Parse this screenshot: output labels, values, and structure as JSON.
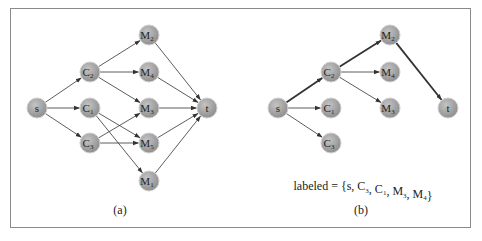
{
  "figure": {
    "colors": {
      "frame": "#8a8a8a",
      "edge": "#333333",
      "node_fill": "#a8a8a8",
      "node_stroke": "#cfcfcf",
      "text": "#222222"
    },
    "panels": [
      {
        "id": "a",
        "caption": "(a)",
        "nodes": [
          {
            "id": "s",
            "base": "s",
            "sub": "",
            "x": 37,
            "y": 108
          },
          {
            "id": "C2",
            "base": "C",
            "sub": "2",
            "x": 90,
            "y": 72
          },
          {
            "id": "C1",
            "base": "C",
            "sub": "1",
            "x": 90,
            "y": 108
          },
          {
            "id": "C3",
            "base": "C",
            "sub": "3",
            "x": 90,
            "y": 143
          },
          {
            "id": "M2",
            "base": "M",
            "sub": "2",
            "x": 149,
            "y": 35
          },
          {
            "id": "M4",
            "base": "M",
            "sub": "4",
            "x": 149,
            "y": 72
          },
          {
            "id": "M3",
            "base": "M",
            "sub": "3",
            "x": 149,
            "y": 108
          },
          {
            "id": "M5",
            "base": "M",
            "sub": "5",
            "x": 149,
            "y": 143
          },
          {
            "id": "M1",
            "base": "M",
            "sub": "1",
            "x": 149,
            "y": 181
          },
          {
            "id": "t",
            "base": "t",
            "sub": "",
            "x": 207,
            "y": 108
          }
        ],
        "edges": [
          {
            "from": "s",
            "to": "C2",
            "bold": false
          },
          {
            "from": "s",
            "to": "C1",
            "bold": false
          },
          {
            "from": "s",
            "to": "C3",
            "bold": false
          },
          {
            "from": "C2",
            "to": "M2",
            "bold": false
          },
          {
            "from": "C2",
            "to": "M4",
            "bold": false
          },
          {
            "from": "C2",
            "to": "M3",
            "bold": false
          },
          {
            "from": "C1",
            "to": "M5",
            "bold": false
          },
          {
            "from": "C1",
            "to": "M1",
            "bold": false
          },
          {
            "from": "C3",
            "to": "M3",
            "bold": false
          },
          {
            "from": "C3",
            "to": "M5",
            "bold": false
          },
          {
            "from": "M2",
            "to": "t",
            "bold": false
          },
          {
            "from": "M4",
            "to": "t",
            "bold": false
          },
          {
            "from": "M3",
            "to": "t",
            "bold": false
          },
          {
            "from": "M5",
            "to": "t",
            "bold": false
          },
          {
            "from": "M1",
            "to": "t",
            "bold": false
          }
        ]
      },
      {
        "id": "b",
        "caption": "(b)",
        "annotation": {
          "prefix": "labeled = {s, C",
          "parts": [
            {
              "t": "labeled = {s, C"
            },
            {
              "sub": "3"
            },
            {
              "t": ", C"
            },
            {
              "sub": "1"
            },
            {
              "t": ", M"
            },
            {
              "sub": "3"
            },
            {
              "t": ", M"
            },
            {
              "sub": "4"
            },
            {
              "t": "}"
            }
          ]
        },
        "nodes": [
          {
            "id": "s",
            "base": "s",
            "sub": "",
            "x": 278,
            "y": 108
          },
          {
            "id": "C2",
            "base": "C",
            "sub": "2",
            "x": 331,
            "y": 72
          },
          {
            "id": "C1",
            "base": "C",
            "sub": "1",
            "x": 331,
            "y": 108
          },
          {
            "id": "C3",
            "base": "C",
            "sub": "3",
            "x": 331,
            "y": 143
          },
          {
            "id": "M2",
            "base": "M",
            "sub": "2",
            "x": 390,
            "y": 35
          },
          {
            "id": "M4",
            "base": "M",
            "sub": "4",
            "x": 390,
            "y": 72
          },
          {
            "id": "M3",
            "base": "M",
            "sub": "3",
            "x": 390,
            "y": 108
          },
          {
            "id": "t",
            "base": "t",
            "sub": "",
            "x": 448,
            "y": 108
          }
        ],
        "edges": [
          {
            "from": "s",
            "to": "C2",
            "bold": true
          },
          {
            "from": "s",
            "to": "C1",
            "bold": false
          },
          {
            "from": "s",
            "to": "C3",
            "bold": false
          },
          {
            "from": "C2",
            "to": "M2",
            "bold": true
          },
          {
            "from": "C2",
            "to": "M4",
            "bold": false
          },
          {
            "from": "C2",
            "to": "M3",
            "bold": false
          },
          {
            "from": "M2",
            "to": "t",
            "bold": true
          }
        ]
      }
    ]
  }
}
